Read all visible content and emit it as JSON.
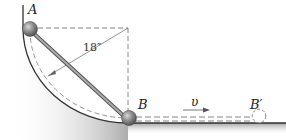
{
  "diagram": {
    "labels": {
      "point_a": "A",
      "point_b": "B",
      "point_b_prime": "B′",
      "velocity": "υ",
      "radius": "18″"
    },
    "colors": {
      "surface_shade": "#9a9a9a",
      "rod": "#8c8c8c",
      "ball": "#7d7d7d",
      "dashed": "#777777",
      "text": "#222222"
    }
  }
}
